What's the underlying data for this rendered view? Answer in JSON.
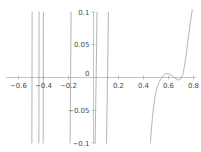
{
  "chart_data": {
    "type": "line",
    "title": "",
    "subtitle": "",
    "xlabel": "",
    "ylabel": "",
    "xlim": [
      -0.7,
      0.82
    ],
    "ylim": [
      -0.1,
      0.1
    ],
    "grid": false,
    "legend": null,
    "axis_style": "crossed-at-origin",
    "xticks": [
      -0.6,
      -0.4,
      -0.2,
      0.2,
      0.4,
      0.6,
      0.8
    ],
    "xtick_labels": [
      "-0.6",
      "-0.4",
      "-0.2",
      "0.2",
      "0.4",
      "0.6",
      "0.8"
    ],
    "yticks": [
      -0.1,
      -0.05,
      0.05,
      0.1
    ],
    "ytick_labels": [
      "-0.1",
      "-0.05",
      "0.05",
      "0.1"
    ],
    "origin_label": "0",
    "series": [
      {
        "name": "f(x)",
        "color": "#8c8c8c",
        "description": "rational function with several poles; clipped at y = +/-0.1",
        "asymptotes": [
          -0.492,
          -0.436,
          -0.402,
          -0.185,
          0.02,
          0.112
        ],
        "branches": [
          {
            "name": "pole-branch-1",
            "x": [
              -0.493,
              -0.4925,
              -0.492,
              -0.4915,
              -0.491
            ],
            "y": [
              -0.1,
              -0.04,
              0.0,
              0.05,
              0.1
            ]
          },
          {
            "name": "pole-branch-2",
            "x": [
              -0.437,
              -0.4365,
              -0.436,
              -0.4355,
              -0.435
            ],
            "y": [
              -0.1,
              -0.04,
              0.0,
              0.05,
              0.1
            ]
          },
          {
            "name": "pole-branch-3",
            "x": [
              -0.403,
              -0.4025,
              -0.402,
              -0.4015,
              -0.401
            ],
            "y": [
              -0.1,
              -0.04,
              0.0,
              0.05,
              0.1
            ]
          },
          {
            "name": "pole-branch-4",
            "x": [
              -0.179,
              -0.181,
              -0.183,
              -0.185,
              -0.187
            ],
            "y": [
              0.1,
              0.05,
              0.0,
              -0.05,
              -0.1
            ]
          },
          {
            "name": "pole-branch-5",
            "x": [
              0.028,
              0.025,
              0.021,
              0.017,
              0.013
            ],
            "y": [
              0.1,
              0.05,
              0.0,
              -0.05,
              -0.1
            ]
          },
          {
            "name": "pole-branch-6",
            "x": [
              0.119,
              0.116,
              0.112,
              0.108,
              0.104
            ],
            "y": [
              0.1,
              0.05,
              0.0,
              -0.05,
              -0.1
            ]
          },
          {
            "name": "main-branch",
            "x": [
              0.455,
              0.462,
              0.47,
              0.48,
              0.492,
              0.505,
              0.52,
              0.54,
              0.56,
              0.58,
              0.6,
              0.62,
              0.64,
              0.66,
              0.68,
              0.7,
              0.715,
              0.73,
              0.745,
              0.76,
              0.775,
              0.79
            ],
            "y": [
              -0.1,
              -0.082,
              -0.064,
              -0.046,
              -0.03,
              -0.018,
              -0.009,
              -0.002,
              0.003,
              0.006,
              0.006,
              0.004,
              0.001,
              -0.002,
              -0.004,
              -0.002,
              0.005,
              0.02,
              0.04,
              0.062,
              0.084,
              0.103
            ]
          }
        ]
      }
    ]
  }
}
